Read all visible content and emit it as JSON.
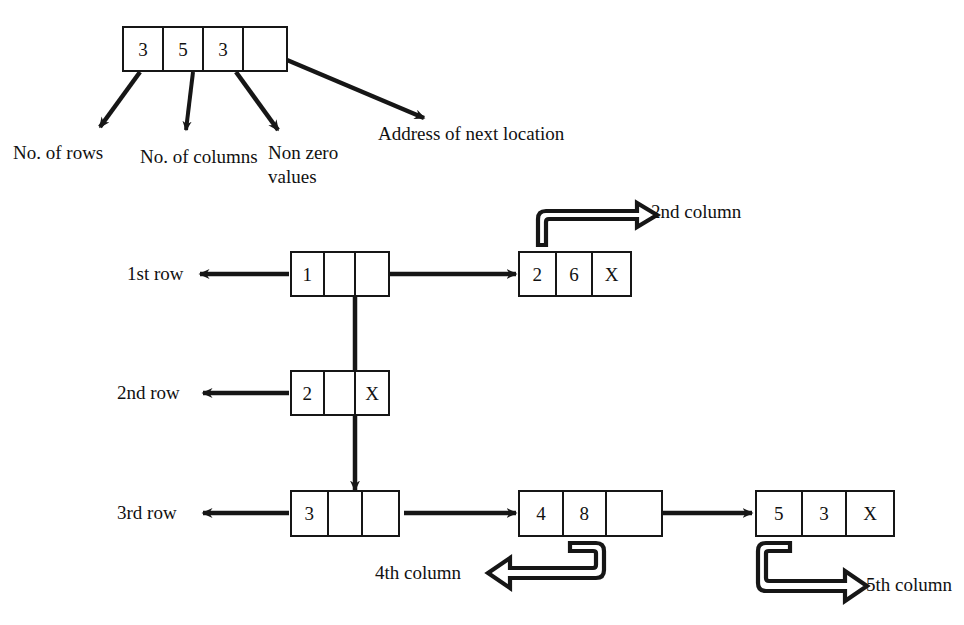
{
  "diagram": {
    "ink_color": "#161616"
  },
  "header_node": {
    "name": "header-node",
    "cells": [
      {
        "value": "3",
        "meaning": "No. of rows"
      },
      {
        "value": "5",
        "meaning": "No. of columns"
      },
      {
        "value": "3",
        "meaning": "Non zero values"
      },
      {
        "value": "",
        "meaning": "Address of next location"
      }
    ]
  },
  "header_labels": [
    {
      "id": "no-of-rows",
      "text": "No. of rows"
    },
    {
      "id": "no-of-columns",
      "text": "No. of columns"
    },
    {
      "id": "non-zero-values-line1",
      "text": "Non zero"
    },
    {
      "id": "non-zero-values-line2",
      "text": "values"
    },
    {
      "id": "address-of-next-location",
      "text": "Address of next location"
    }
  ],
  "row_labels": [
    {
      "id": "row-label-1",
      "text": "1st row"
    },
    {
      "id": "row-label-2",
      "text": "2nd row"
    },
    {
      "id": "row-label-3",
      "text": "3rd row"
    }
  ],
  "column_labels": [
    {
      "id": "column-label-2",
      "text": "2nd column"
    },
    {
      "id": "column-label-4",
      "text": "4th column"
    },
    {
      "id": "column-label-5",
      "text": "5th column"
    }
  ],
  "row_nodes": [
    {
      "id": "row-node-1",
      "row": "1st row",
      "cells": [
        {
          "value": "1",
          "meaning": "row number"
        },
        {
          "value": "",
          "meaning": "down pointer"
        },
        {
          "value": "",
          "meaning": "right pointer"
        }
      ]
    },
    {
      "id": "row-node-2",
      "row": "2nd row",
      "cells": [
        {
          "value": "2",
          "meaning": "row number"
        },
        {
          "value": "",
          "meaning": "down pointer"
        },
        {
          "value": "X",
          "meaning": "null right pointer"
        }
      ]
    },
    {
      "id": "row-node-3",
      "row": "3rd row",
      "cells": [
        {
          "value": "3",
          "meaning": "row number"
        },
        {
          "value": "",
          "meaning": "down pointer"
        },
        {
          "value": "",
          "meaning": "right pointer"
        }
      ]
    }
  ],
  "element_nodes": [
    {
      "id": "element-node-r1c2",
      "column": "2nd column",
      "cells": [
        {
          "value": "2",
          "meaning": "column number"
        },
        {
          "value": "6",
          "meaning": "value"
        },
        {
          "value": "X",
          "meaning": "null next pointer"
        }
      ]
    },
    {
      "id": "element-node-r3c4",
      "column": "4th column",
      "cells": [
        {
          "value": "4",
          "meaning": "column number"
        },
        {
          "value": "8",
          "meaning": "value"
        },
        {
          "value": "",
          "meaning": "next pointer"
        }
      ]
    },
    {
      "id": "element-node-r3c5",
      "column": "5th column",
      "cells": [
        {
          "value": "5",
          "meaning": "column number"
        },
        {
          "value": "3",
          "meaning": "value"
        },
        {
          "value": "X",
          "meaning": "null next pointer"
        }
      ]
    }
  ]
}
